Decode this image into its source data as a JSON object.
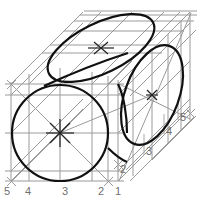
{
  "figure": {
    "kind": "technical-line-drawing",
    "background_color": "#ffffff",
    "construction_line_color": "#9a9a9a",
    "outline_color": "#111111",
    "label_color": "#6f6f6f"
  },
  "labels": {
    "bottom_axis": [
      {
        "text": "5",
        "x": 4,
        "y": 186
      },
      {
        "text": "4",
        "x": 25,
        "y": 186
      },
      {
        "text": "3",
        "x": 62,
        "y": 186
      },
      {
        "text": "2",
        "x": 98,
        "y": 186
      },
      {
        "text": "1",
        "x": 115,
        "y": 186
      }
    ],
    "right_axis": [
      {
        "text": "2",
        "x": 120,
        "y": 164
      },
      {
        "text": "3",
        "x": 146,
        "y": 146
      },
      {
        "text": "4",
        "x": 166,
        "y": 126
      },
      {
        "text": "5",
        "x": 180,
        "y": 112
      }
    ]
  },
  "shapes": {
    "front_circle": {
      "name": "front-face-circle",
      "cx": 60,
      "cy": 133,
      "r": 48
    },
    "top_ellipse": {
      "name": "top-face-ellipse",
      "cx": 101,
      "cy": 48,
      "rx": 58,
      "ry": 25,
      "rotation": -26
    },
    "right_ellipse": {
      "name": "right-face-ellipse",
      "cx": 152,
      "cy": 95,
      "rx": 27,
      "ry": 52,
      "rotation": 20
    },
    "center_marks": [
      {
        "name": "front-circle-center-mark",
        "cx": 60,
        "cy": 133
      },
      {
        "name": "top-ellipse-center-mark",
        "cx": 101,
        "cy": 48
      },
      {
        "name": "right-ellipse-center-mark",
        "cx": 152,
        "cy": 95
      }
    ]
  }
}
